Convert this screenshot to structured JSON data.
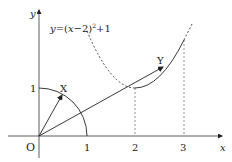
{
  "diagram": {
    "type": "coordinate-geometry",
    "axes": {
      "x_label": "x",
      "y_label": "y",
      "origin_label": "O",
      "x_ticks": [
        "1",
        "2",
        "3"
      ],
      "y_ticks": [
        "1"
      ]
    },
    "curve": {
      "equation_label": "y=(x−2)²+1",
      "equation_prefix": "y=(",
      "equation_var": "x",
      "equation_mid": "−2)",
      "equation_exp": "2",
      "equation_suffix": "+1",
      "vertex": [
        2,
        1
      ],
      "solid_from_x": 2,
      "dashed_to_x": 2
    },
    "unit_circle_arc": {
      "radius": 1,
      "from_deg": 0,
      "to_deg": 90
    },
    "points": {
      "X": {
        "label": "X",
        "coords_approx": [
          0.49,
          0.87
        ]
      },
      "Y": {
        "label": "Y",
        "coords_approx": [
          2.6,
          1.36
        ]
      }
    },
    "guides": {
      "dashed_verticals_at_x": [
        2,
        3
      ]
    },
    "colors": {
      "line": "#222222",
      "background": "#ffffff"
    }
  }
}
